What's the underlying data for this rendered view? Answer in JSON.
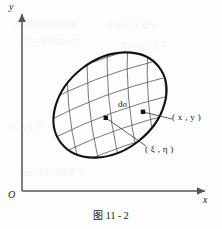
{
  "figure": {
    "caption": "图 11 - 2",
    "axes": {
      "y_label": "y",
      "x_label": "x",
      "origin_label": "O"
    },
    "annotations": {
      "area_element": "dσ",
      "area_element_d": "d",
      "area_element_sigma": "σ",
      "point_xy": "( x , y )",
      "point_xieta": "( ξ , η )"
    },
    "colors": {
      "ink": "#1b1b1b",
      "boundary": "#111111",
      "grid": "#555555",
      "axis": "#555555",
      "background": "#fdfdfd"
    }
  },
  "bleed_text": {
    "lines": [
      "在区域上积分得到",
      "的面积元素为",
      "于是有下面的公式",
      "其中积分号下",
      "代入可得",
      "因此所求的结果为"
    ]
  }
}
